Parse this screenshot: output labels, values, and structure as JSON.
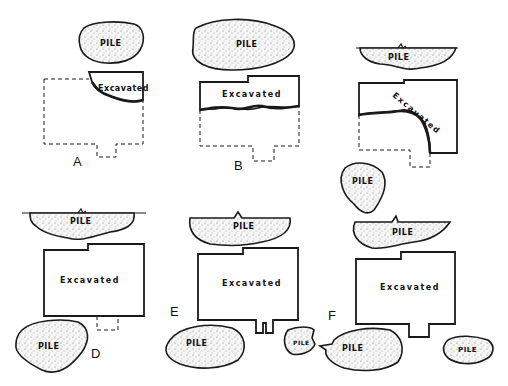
{
  "diagram": {
    "type": "excavation-pile-layout",
    "panels": [
      {
        "id": "A",
        "label": "A",
        "pile_label": "PILE",
        "excavated_label": "Excavated",
        "description": "Small corner excavation, pile above"
      },
      {
        "id": "B",
        "label": "B",
        "pile_label": "PILE",
        "excavated_label": "Excavated",
        "description": "Upper strip excavated, pile above"
      },
      {
        "id": "C",
        "label": "",
        "pile_labels": [
          "PILE",
          "PILE"
        ],
        "excavated_label": "Excavated",
        "description": "L-shaped excavation, pile along ground line and pile to lower left"
      },
      {
        "id": "D",
        "label": "D",
        "pile_labels": [
          "PILE",
          "PILE"
        ],
        "excavated_label": "Excavated",
        "description": "Fully excavated, piles above and below-left"
      },
      {
        "id": "E",
        "label": "E",
        "pile_labels": [
          "PILE",
          "PILE",
          "PILE"
        ],
        "excavated_label": "Excavated",
        "description": "Fully excavated with double-notch entry, piles above and below"
      },
      {
        "id": "F",
        "label": "F",
        "pile_labels": [
          "PILE",
          "PILE",
          "PILE"
        ],
        "excavated_label": "Excavated",
        "description": "Fully excavated with entry notch, piles above and below"
      }
    ]
  },
  "labels": {
    "pile": "PILE",
    "excavated": "Excavated",
    "panel_a": "A",
    "panel_b": "B",
    "panel_d": "D",
    "panel_e": "E",
    "panel_f": "F"
  },
  "colors": {
    "ink": "#1a1a1a",
    "pile_fill": "#f4f4f4",
    "background": "#ffffff"
  }
}
